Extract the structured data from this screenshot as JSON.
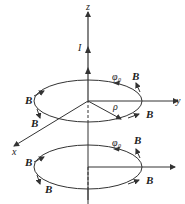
{
  "figure": {
    "colors": {
      "line": "#333333",
      "background": "#ffffff"
    },
    "axes": {
      "z_label": "z",
      "y_label": "y",
      "x_label": "x"
    },
    "current_label": "I",
    "radius_label": "ρ",
    "upper_loop": {
      "direction_label": "φ",
      "direction_sub": "0",
      "field_labels": [
        "B",
        "B",
        "B",
        "B"
      ]
    },
    "lower_loop": {
      "direction_label": "φ",
      "direction_sub": "0",
      "field_labels": [
        "B",
        "B",
        "B",
        "B"
      ]
    }
  }
}
